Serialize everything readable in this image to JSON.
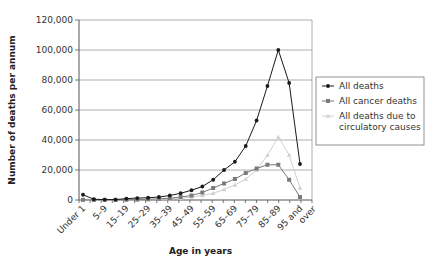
{
  "chart_data": {
    "type": "line",
    "title": "",
    "xlabel": "Age in years",
    "ylabel": "Number of deaths per annum",
    "ylim": [
      0,
      120000
    ],
    "yticks": [
      0,
      20000,
      40000,
      60000,
      80000,
      100000,
      120000
    ],
    "ytick_labels": [
      "0",
      "20,000",
      "40,000",
      "60,000",
      "80,000",
      "100,000",
      "120,000"
    ],
    "grid": "horizontal",
    "legend_position": "right",
    "categories": [
      "Under 1",
      "1–4",
      "5–9",
      "10–14",
      "15–19",
      "20–24",
      "25–29",
      "30–34",
      "35–39",
      "40–44",
      "45–49",
      "50–54",
      "55–59",
      "60–64",
      "65–69",
      "70–74",
      "75–79",
      "80–84",
      "85–89",
      "90–94",
      "95 and over"
    ],
    "xtick_labels_shown": [
      "Under 1",
      "5–9",
      "15–19",
      "25–29",
      "35–39",
      "45–49",
      "55–59",
      "65–69",
      "75–79",
      "85–89",
      "95 and over"
    ],
    "series": [
      {
        "name": "All deaths",
        "color": "#1a1a1a",
        "marker": "diamond",
        "values": [
          3500,
          500,
          300,
          300,
          900,
          1300,
          1500,
          2000,
          3000,
          4500,
          6500,
          9000,
          13500,
          20000,
          25500,
          36000,
          53000,
          76000,
          100000,
          78000,
          24000
        ]
      },
      {
        "name": "All cancer deaths",
        "color": "#7a7a7a",
        "marker": "square",
        "values": [
          100,
          100,
          100,
          100,
          200,
          300,
          500,
          800,
          1200,
          2000,
          3000,
          5000,
          8000,
          11000,
          14000,
          18000,
          21000,
          23500,
          23500,
          13500,
          2000
        ]
      },
      {
        "name": "All deaths due to circulatory causes",
        "color": "#d0d0d0",
        "marker": "triangle",
        "values": [
          100,
          50,
          50,
          50,
          100,
          200,
          300,
          500,
          800,
          1300,
          2000,
          3000,
          4500,
          7000,
          10000,
          14000,
          20000,
          30000,
          42000,
          30000,
          8000
        ]
      }
    ]
  }
}
